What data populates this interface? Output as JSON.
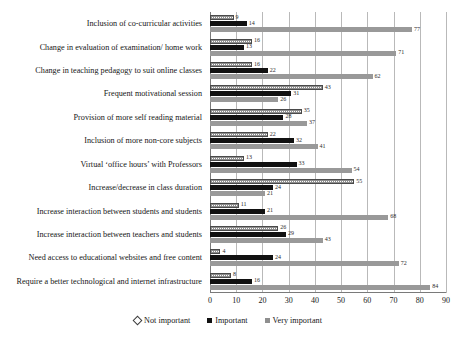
{
  "chart_data": {
    "type": "bar",
    "orientation": "horizontal",
    "title": "",
    "xlabel": "",
    "ylabel": "",
    "xlim": [
      0,
      90
    ],
    "xticks": [
      0,
      10,
      20,
      30,
      40,
      50,
      60,
      70,
      80,
      90
    ],
    "grid": true,
    "legend_position": "bottom-center",
    "categories": [
      "Inclusion of co-curricular activities",
      "Change in evaluation of examination/ home work",
      "Change in teaching pedagogy to suit online classes",
      "Frequent motivational session",
      "Provision of more self reading material",
      "Inclusion of more non-core subjects",
      "Virtual ‘office hours’ with Professors",
      "Increase/decrease in class duration",
      "Increase interaction between students and students",
      "Increase interaction between teachers and students",
      "Need access to educational websites and free content",
      "Require a better technological and internet infrastructure"
    ],
    "series": [
      {
        "name": "Not important",
        "color": "#ffffff",
        "pattern": "dotted-hatch",
        "values": [
          9,
          16,
          16,
          43,
          35,
          22,
          13,
          55,
          11,
          26,
          4,
          8
        ]
      },
      {
        "name": "Important",
        "color": "#111111",
        "pattern": "solid",
        "values": [
          14,
          13,
          22,
          31,
          28,
          32,
          33,
          24,
          21,
          29,
          24,
          16
        ]
      },
      {
        "name": "Very important",
        "color": "#999999",
        "pattern": "solid",
        "values": [
          77,
          71,
          62,
          26,
          37,
          41,
          54,
          21,
          68,
          43,
          72,
          84
        ]
      }
    ]
  },
  "legend": {
    "items": [
      {
        "label": "Not important",
        "marker": "diamond-outline-icon"
      },
      {
        "label": "Important",
        "marker": "square-black-icon"
      },
      {
        "label": "Very important",
        "marker": "square-gray-icon"
      }
    ]
  }
}
